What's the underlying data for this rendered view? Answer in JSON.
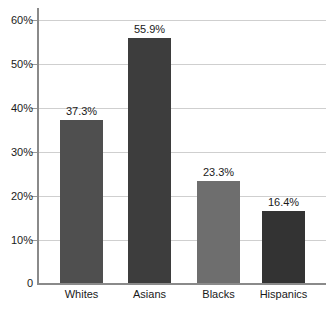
{
  "chart_data": {
    "type": "bar",
    "title": "",
    "subtitle": "",
    "xlabel": "",
    "ylabel": "",
    "categories": [
      "Whites",
      "Asians",
      "Blacks",
      "Hispanics"
    ],
    "values": [
      37.3,
      55.9,
      23.3,
      16.4
    ],
    "value_labels": [
      "37.3%",
      "55.9%",
      "23.3%",
      "16.4%"
    ],
    "bar_colors": [
      "#4f4f4f",
      "#3d3d3d",
      "#6e6e6e",
      "#333333"
    ],
    "ylim": [
      0,
      60
    ],
    "ytick_values": [
      0,
      10,
      20,
      30,
      40,
      50,
      60
    ],
    "ytick_labels": [
      "0",
      "10%",
      "20%",
      "30%",
      "40%",
      "50%",
      "60%"
    ],
    "grid": true,
    "grid_color": "#cfcfcf",
    "legend": null,
    "legend_position": "none",
    "axis_color": "#8a8a8a",
    "background": "#ffffff",
    "text_color": "#1a1a1a"
  }
}
